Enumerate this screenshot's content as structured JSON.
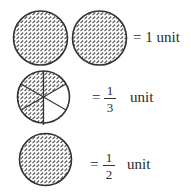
{
  "rows": [
    {
      "id": "one-unit",
      "circles": 2,
      "shading": "full",
      "label": {
        "equals": "=",
        "value": "1",
        "unit": "unit",
        "text": "= 1 unit"
      }
    },
    {
      "id": "one-third-unit",
      "circles": 1,
      "sectors": 6,
      "shaded_sectors": 4,
      "label": {
        "equals": "=",
        "numerator": "1",
        "denominator": "3",
        "unit": "unit"
      }
    },
    {
      "id": "one-half-unit",
      "circles": 1,
      "shading": "full",
      "label": {
        "equals": "=",
        "numerator": "1",
        "denominator": "2",
        "unit": "unit"
      }
    }
  ],
  "colors": {
    "stroke": "#333333",
    "hatch": "#555555",
    "background": "#ffffff"
  }
}
